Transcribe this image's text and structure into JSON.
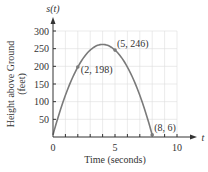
{
  "chart_data": {
    "type": "line",
    "title": "",
    "xlabel": "Time (seconds)",
    "ylabel": "Height above Ground (feet)",
    "x_axis_var": "t",
    "y_axis_var": "s(t)",
    "xlim": [
      0,
      10
    ],
    "ylim": [
      0,
      300
    ],
    "x_ticks": [
      0,
      5,
      10
    ],
    "x_minor_tick_step": 1,
    "y_ticks": [
      50,
      100,
      150,
      200,
      250,
      300
    ],
    "grid": true,
    "series": [
      {
        "name": "s(t)",
        "function": "s(t) = -16t^2 + 128t + 6",
        "x": [
          0,
          0.5,
          1,
          1.5,
          2,
          2.5,
          3,
          3.5,
          4,
          4.5,
          5,
          5.5,
          6,
          6.5,
          7,
          7.5,
          8
        ],
        "values": [
          6,
          66,
          118,
          162,
          198,
          226,
          246,
          258,
          262,
          258,
          246,
          226,
          198,
          162,
          118,
          66,
          6
        ]
      }
    ],
    "annotations": [
      {
        "label": "(2, 198)",
        "x": 2,
        "y": 198
      },
      {
        "label": "(5, 246)",
        "x": 5,
        "y": 246
      },
      {
        "label": "(8, 6)",
        "x": 8,
        "y": 6
      }
    ],
    "colors": {
      "curve": "#7a7a7a",
      "axis": "#333333",
      "grid": "#dddddd"
    }
  }
}
